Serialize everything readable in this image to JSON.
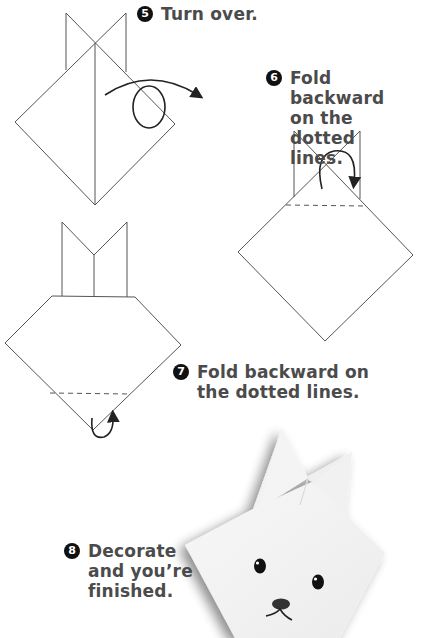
{
  "steps": [
    {
      "number": "5",
      "lines": [
        "Turn over."
      ]
    },
    {
      "number": "6",
      "lines": [
        "Fold backward",
        "on the dotted",
        "lines."
      ]
    },
    {
      "number": "7",
      "lines": [
        "Fold backward on",
        "the dotted lines."
      ]
    },
    {
      "number": "8",
      "lines": [
        "Decorate",
        "and you’re",
        "finished."
      ]
    }
  ],
  "icons": {
    "step5": "turn-over-arrow",
    "step6": "fold-backward-arrow",
    "step7": "fold-backward-arrow",
    "step8": "finished-bunny-photo"
  },
  "colors": {
    "line": "#555555",
    "text": "#4b4b4b",
    "badge": "#111111",
    "paper": "#f4f4f4"
  }
}
